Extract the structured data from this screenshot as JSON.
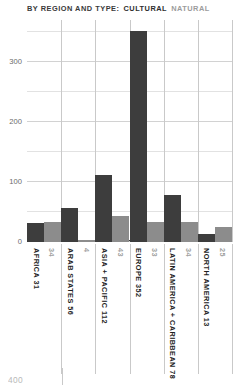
{
  "header": {
    "title_lead": "BY REGION AND TYPE:",
    "legend_cultural": "CULTURAL",
    "legend_natural": "NATURAL"
  },
  "colors": {
    "cultural": "#3d3d3d",
    "natural": "#8c8c8c",
    "grid": "#d2d2d2",
    "grid_minor": "#e2e2e2",
    "axis": "#3a3a3a",
    "label_cultural": "#1f1f1f",
    "label_natural": "#a0a0a0"
  },
  "footer": {
    "clipped_number": "400"
  },
  "chart_data": {
    "type": "bar",
    "title": "BY REGION AND TYPE: CULTURAL NATURAL",
    "xlabel": "",
    "ylabel": "",
    "ylim": [
      0,
      370
    ],
    "yticks": [
      0,
      100,
      200,
      300
    ],
    "yticks_minor": [
      50,
      150,
      250,
      350
    ],
    "ytick_labels": [
      "0",
      "100",
      "200",
      "300"
    ],
    "grid": true,
    "legend_position": "title-inline",
    "categories": [
      "AFRICA",
      "ARAB STATES",
      "ASIA + PACIFIC",
      "EUROPE",
      "LATIN AMERICA + CARIBBEAN",
      "NORTH AMERICA"
    ],
    "series": [
      {
        "name": "CULTURAL",
        "color": "#3d3d3d",
        "values": [
          31,
          56,
          112,
          352,
          78,
          13
        ]
      },
      {
        "name": "NATURAL",
        "color": "#8c8c8c",
        "values": [
          34,
          4,
          43,
          33,
          34,
          25
        ]
      }
    ],
    "bar_labels": [
      {
        "category": "AFRICA",
        "cultural": "31",
        "natural": "34"
      },
      {
        "category": "ARAB STATES",
        "cultural": "56",
        "natural": "4"
      },
      {
        "category": "ASIA + PACIFIC",
        "cultural": "112",
        "natural": "43"
      },
      {
        "category": "EUROPE",
        "cultural": "352",
        "natural": "33"
      },
      {
        "category": "LATIN AMERICA + CARIBBEAN",
        "cultural": "78",
        "natural": "34"
      },
      {
        "category": "NORTH AMERICA",
        "cultural": "13",
        "natural": "25"
      }
    ],
    "axis_labels": [
      {
        "cultural": "AFRICA 31",
        "natural": "34"
      },
      {
        "cultural": "ARAB STATES 56",
        "natural": "4"
      },
      {
        "cultural": "ASIA + PACIFIC 112",
        "natural": "43"
      },
      {
        "cultural": "EUROPE 352",
        "natural": "33"
      },
      {
        "cultural": "LATIN AMERICA + CARIBBEAN 78",
        "natural": "34"
      },
      {
        "cultural": "NORTH AMERICA 13",
        "natural": "25"
      }
    ]
  }
}
